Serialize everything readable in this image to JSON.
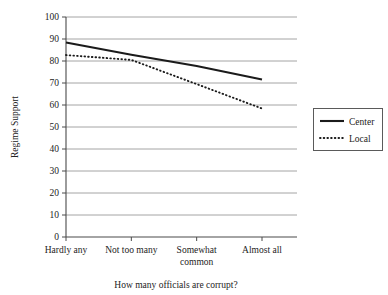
{
  "chart_data": {
    "type": "line",
    "title": "",
    "xlabel": "How many officials are corrupt?",
    "ylabel": "Regime Support",
    "categories": [
      "Hardly any",
      "Not too many",
      "Somewhat common",
      "Almost all"
    ],
    "category_lines": [
      [
        "Hardly any"
      ],
      [
        "Not too many"
      ],
      [
        "Somewhat",
        "common"
      ],
      [
        "Almost all"
      ]
    ],
    "series": [
      {
        "name": "Center",
        "values": [
          88.4,
          82.8,
          77.7,
          71.6
        ],
        "style": "solid"
      },
      {
        "name": "Local",
        "values": [
          82.7,
          80.5,
          69.5,
          58.4
        ],
        "style": "dotted"
      }
    ],
    "ylim": [
      0,
      100
    ],
    "yticks": [
      0,
      10,
      20,
      30,
      40,
      50,
      60,
      70,
      80,
      90,
      100
    ],
    "ytick_labels": [
      "0",
      "10",
      "20",
      "30",
      "40",
      "50",
      "60",
      "70",
      "80",
      "90",
      "100"
    ],
    "grid": "horizontal",
    "legend_position": "right",
    "colors": {
      "line": "#1b1b1b",
      "grid": "#9a9a9a",
      "axis": "#4a4a4a",
      "background": "#ffffff"
    }
  },
  "legend": {
    "entries": [
      {
        "label": "Center",
        "style": "solid"
      },
      {
        "label": "Local",
        "style": "dotted"
      }
    ]
  }
}
